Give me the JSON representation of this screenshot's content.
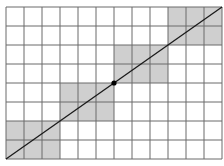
{
  "diagram": {
    "type": "grid-with-diagonal",
    "grid": {
      "columns": 12,
      "rows": 8,
      "left": 6,
      "top": 7,
      "right": 222,
      "bottom": 159
    },
    "colors": {
      "background": "#ffffff",
      "grid_line": "#6a6a6a",
      "shade": "#cfcfcf",
      "diagonal": "#1a1a1a",
      "center_dot": "#000000"
    },
    "shaded_blocks": [
      {
        "col": 0,
        "row": 6,
        "w": 3,
        "h": 2
      },
      {
        "col": 3,
        "row": 4,
        "w": 3,
        "h": 2
      },
      {
        "col": 6,
        "row": 2,
        "w": 3,
        "h": 2
      },
      {
        "col": 9,
        "row": 0,
        "w": 3,
        "h": 2
      }
    ],
    "diagonal": {
      "from": "bottom-left",
      "to": "top-right"
    },
    "center_point": {
      "col": 6,
      "row": 4
    }
  }
}
